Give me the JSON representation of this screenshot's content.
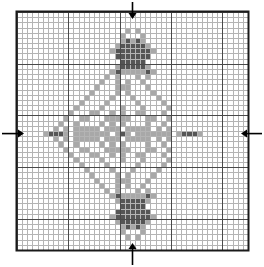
{
  "document": {
    "title": "Cross Stitch Pattern Chart",
    "type": "needlework-chart",
    "description": "Symmetric diamond compass-rose motif on counted grid"
  },
  "chart_data": {
    "type": "heatmap",
    "title": "",
    "xlabel": "",
    "ylabel": "",
    "grid": true,
    "legend_position": "none",
    "cols": 45,
    "rows": 46,
    "bold_every": 10,
    "center_col": 22,
    "center_row": 23,
    "palette": {
      "empty": "#ffffff",
      "light": "#a8a8a8",
      "dark": "#555555"
    },
    "symbols": {
      "0": "empty",
      "1": "light",
      "2": "dark"
    },
    "rle_rows": [
      [
        [
          0,
          45
        ]
      ],
      [
        [
          0,
          45
        ]
      ],
      [
        [
          0,
          45
        ]
      ],
      [
        [
          0,
          21
        ],
        [
          1,
          1
        ],
        [
          0,
          1
        ],
        [
          1,
          1
        ],
        [
          0,
          21
        ]
      ],
      [
        [
          0,
          20
        ],
        [
          1,
          1
        ],
        [
          0,
          3
        ],
        [
          1,
          1
        ],
        [
          0,
          20
        ]
      ],
      [
        [
          0,
          20
        ],
        [
          1,
          1
        ],
        [
          2,
          1
        ],
        [
          1,
          1
        ],
        [
          2,
          1
        ],
        [
          1,
          1
        ],
        [
          0,
          20
        ]
      ],
      [
        [
          0,
          19
        ],
        [
          1,
          1
        ],
        [
          2,
          5
        ],
        [
          1,
          1
        ],
        [
          0,
          19
        ]
      ],
      [
        [
          0,
          18
        ],
        [
          1,
          1
        ],
        [
          2,
          7
        ],
        [
          1,
          1
        ],
        [
          0,
          18
        ]
      ],
      [
        [
          0,
          19
        ],
        [
          2,
          7
        ],
        [
          0,
          19
        ]
      ],
      [
        [
          0,
          20
        ],
        [
          2,
          5
        ],
        [
          0,
          20
        ]
      ],
      [
        [
          0,
          19
        ],
        [
          1,
          1
        ],
        [
          2,
          5
        ],
        [
          1,
          1
        ],
        [
          0,
          19
        ]
      ],
      [
        [
          0,
          18
        ],
        [
          1,
          1
        ],
        [
          2,
          1
        ],
        [
          1,
          5
        ],
        [
          2,
          1
        ],
        [
          1,
          1
        ],
        [
          0,
          18
        ]
      ],
      [
        [
          0,
          17
        ],
        [
          1,
          1
        ],
        [
          0,
          1
        ],
        [
          1,
          1
        ],
        [
          0,
          3
        ],
        [
          1,
          1
        ],
        [
          0,
          1
        ],
        [
          1,
          1
        ],
        [
          0,
          17
        ]
      ],
      [
        [
          0,
          16
        ],
        [
          1,
          1
        ],
        [
          0,
          2
        ],
        [
          1,
          1
        ],
        [
          0,
          1
        ],
        [
          1,
          1
        ],
        [
          0,
          2
        ],
        [
          1,
          1
        ],
        [
          0,
          16
        ]
      ],
      [
        [
          0,
          15
        ],
        [
          1,
          1
        ],
        [
          0,
          3
        ],
        [
          1,
          3
        ],
        [
          0,
          3
        ],
        [
          1,
          1
        ],
        [
          0,
          15
        ]
      ],
      [
        [
          0,
          14
        ],
        [
          1,
          1
        ],
        [
          0,
          4
        ],
        [
          1,
          1
        ],
        [
          0,
          1
        ],
        [
          1,
          1
        ],
        [
          0,
          4
        ],
        [
          1,
          1
        ],
        [
          0,
          14
        ]
      ],
      [
        [
          0,
          13
        ],
        [
          1,
          1
        ],
        [
          0,
          4
        ],
        [
          1,
          1
        ],
        [
          0,
          3
        ],
        [
          1,
          1
        ],
        [
          0,
          4
        ],
        [
          1,
          1
        ],
        [
          0,
          13
        ]
      ],
      [
        [
          0,
          12
        ],
        [
          1,
          1
        ],
        [
          0,
          4
        ],
        [
          1,
          1
        ],
        [
          0,
          5
        ],
        [
          1,
          1
        ],
        [
          0,
          4
        ],
        [
          1,
          1
        ],
        [
          0,
          12
        ]
      ],
      [
        [
          0,
          11
        ],
        [
          1,
          1
        ],
        [
          0,
          4
        ],
        [
          1,
          1
        ],
        [
          0,
          3
        ],
        [
          1,
          1
        ],
        [
          0,
          3
        ],
        [
          1,
          1
        ],
        [
          0,
          4
        ],
        [
          1,
          1
        ],
        [
          0,
          11
        ]
      ],
      [
        [
          0,
          10
        ],
        [
          1,
          1
        ],
        [
          0,
          3
        ],
        [
          1,
          2
        ],
        [
          0,
          2
        ],
        [
          1,
          1
        ],
        [
          0,
          1
        ],
        [
          1,
          1
        ],
        [
          0,
          2
        ],
        [
          1,
          2
        ],
        [
          0,
          3
        ],
        [
          1,
          1
        ],
        [
          0,
          10
        ]
      ],
      [
        [
          0,
          9
        ],
        [
          1,
          1
        ],
        [
          0,
          2
        ],
        [
          1,
          2
        ],
        [
          0,
          3
        ],
        [
          1,
          5
        ],
        [
          0,
          3
        ],
        [
          1,
          2
        ],
        [
          0,
          2
        ],
        [
          1,
          1
        ],
        [
          0,
          9
        ]
      ],
      [
        [
          0,
          8
        ],
        [
          1,
          1
        ],
        [
          0,
          2
        ],
        [
          1,
          1
        ],
        [
          0,
          4
        ],
        [
          1,
          1
        ],
        [
          0,
          1
        ],
        [
          1,
          1
        ],
        [
          0,
          1
        ],
        [
          1,
          1
        ],
        [
          0,
          4
        ],
        [
          1,
          1
        ],
        [
          0,
          2
        ],
        [
          1,
          1
        ],
        [
          0,
          8
        ]
      ],
      [
        [
          0,
          7
        ],
        [
          1,
          1
        ],
        [
          0,
          1
        ],
        [
          1,
          1
        ],
        [
          0,
          1
        ],
        [
          1,
          5
        ],
        [
          0,
          1
        ],
        [
          1,
          3
        ],
        [
          0,
          1
        ],
        [
          1,
          5
        ],
        [
          0,
          1
        ],
        [
          1,
          1
        ],
        [
          0,
          1
        ],
        [
          1,
          1
        ],
        [
          0,
          7
        ]
      ],
      [
        [
          0,
          5
        ],
        [
          1,
          1
        ],
        [
          2,
          3
        ],
        [
          1,
          1
        ],
        [
          0,
          1
        ],
        [
          1,
          7
        ],
        [
          0,
          1
        ],
        [
          1,
          1
        ],
        [
          2,
          1
        ],
        [
          1,
          1
        ],
        [
          0,
          1
        ],
        [
          1,
          7
        ],
        [
          0,
          1
        ],
        [
          1,
          1
        ],
        [
          2,
          3
        ],
        [
          1,
          1
        ],
        [
          0,
          5
        ]
      ],
      [
        [
          0,
          7
        ],
        [
          1,
          1
        ],
        [
          0,
          1
        ],
        [
          1,
          1
        ],
        [
          0,
          1
        ],
        [
          1,
          5
        ],
        [
          0,
          1
        ],
        [
          1,
          3
        ],
        [
          0,
          1
        ],
        [
          1,
          5
        ],
        [
          0,
          1
        ],
        [
          1,
          1
        ],
        [
          0,
          1
        ],
        [
          1,
          1
        ],
        [
          0,
          7
        ]
      ],
      [
        [
          0,
          8
        ],
        [
          1,
          1
        ],
        [
          0,
          2
        ],
        [
          1,
          1
        ],
        [
          0,
          4
        ],
        [
          1,
          1
        ],
        [
          0,
          1
        ],
        [
          1,
          1
        ],
        [
          0,
          1
        ],
        [
          1,
          1
        ],
        [
          0,
          4
        ],
        [
          1,
          1
        ],
        [
          0,
          2
        ],
        [
          1,
          1
        ],
        [
          0,
          8
        ]
      ],
      [
        [
          0,
          9
        ],
        [
          1,
          1
        ],
        [
          0,
          2
        ],
        [
          1,
          2
        ],
        [
          0,
          3
        ],
        [
          1,
          5
        ],
        [
          0,
          3
        ],
        [
          1,
          2
        ],
        [
          0,
          2
        ],
        [
          1,
          1
        ],
        [
          0,
          9
        ]
      ],
      [
        [
          0,
          10
        ],
        [
          1,
          1
        ],
        [
          0,
          3
        ],
        [
          1,
          2
        ],
        [
          0,
          2
        ],
        [
          1,
          1
        ],
        [
          0,
          1
        ],
        [
          1,
          1
        ],
        [
          0,
          2
        ],
        [
          1,
          2
        ],
        [
          0,
          3
        ],
        [
          1,
          1
        ],
        [
          0,
          10
        ]
      ],
      [
        [
          0,
          11
        ],
        [
          1,
          1
        ],
        [
          0,
          4
        ],
        [
          1,
          1
        ],
        [
          0,
          3
        ],
        [
          1,
          1
        ],
        [
          0,
          3
        ],
        [
          1,
          1
        ],
        [
          0,
          4
        ],
        [
          1,
          1
        ],
        [
          0,
          11
        ]
      ],
      [
        [
          0,
          12
        ],
        [
          1,
          1
        ],
        [
          0,
          4
        ],
        [
          1,
          1
        ],
        [
          0,
          5
        ],
        [
          1,
          1
        ],
        [
          0,
          4
        ],
        [
          1,
          1
        ],
        [
          0,
          12
        ]
      ],
      [
        [
          0,
          13
        ],
        [
          1,
          1
        ],
        [
          0,
          4
        ],
        [
          1,
          1
        ],
        [
          0,
          3
        ],
        [
          1,
          1
        ],
        [
          0,
          4
        ],
        [
          1,
          1
        ],
        [
          0,
          13
        ]
      ],
      [
        [
          0,
          14
        ],
        [
          1,
          1
        ],
        [
          0,
          4
        ],
        [
          1,
          1
        ],
        [
          0,
          1
        ],
        [
          1,
          1
        ],
        [
          0,
          4
        ],
        [
          1,
          1
        ],
        [
          0,
          14
        ]
      ],
      [
        [
          0,
          15
        ],
        [
          1,
          1
        ],
        [
          0,
          3
        ],
        [
          1,
          3
        ],
        [
          0,
          3
        ],
        [
          1,
          1
        ],
        [
          0,
          15
        ]
      ],
      [
        [
          0,
          16
        ],
        [
          1,
          1
        ],
        [
          0,
          2
        ],
        [
          1,
          1
        ],
        [
          0,
          1
        ],
        [
          1,
          1
        ],
        [
          0,
          2
        ],
        [
          1,
          1
        ],
        [
          0,
          16
        ]
      ],
      [
        [
          0,
          17
        ],
        [
          1,
          1
        ],
        [
          0,
          1
        ],
        [
          1,
          1
        ],
        [
          0,
          3
        ],
        [
          1,
          1
        ],
        [
          0,
          1
        ],
        [
          1,
          1
        ],
        [
          0,
          17
        ]
      ],
      [
        [
          0,
          18
        ],
        [
          1,
          1
        ],
        [
          2,
          1
        ],
        [
          1,
          5
        ],
        [
          2,
          1
        ],
        [
          1,
          1
        ],
        [
          0,
          18
        ]
      ],
      [
        [
          0,
          19
        ],
        [
          1,
          1
        ],
        [
          2,
          5
        ],
        [
          1,
          1
        ],
        [
          0,
          19
        ]
      ],
      [
        [
          0,
          20
        ],
        [
          2,
          5
        ],
        [
          0,
          20
        ]
      ],
      [
        [
          0,
          19
        ],
        [
          2,
          7
        ],
        [
          0,
          19
        ]
      ],
      [
        [
          0,
          18
        ],
        [
          1,
          1
        ],
        [
          2,
          7
        ],
        [
          1,
          1
        ],
        [
          0,
          18
        ]
      ],
      [
        [
          0,
          19
        ],
        [
          1,
          1
        ],
        [
          2,
          5
        ],
        [
          1,
          1
        ],
        [
          0,
          19
        ]
      ],
      [
        [
          0,
          20
        ],
        [
          1,
          1
        ],
        [
          2,
          1
        ],
        [
          1,
          1
        ],
        [
          2,
          1
        ],
        [
          1,
          1
        ],
        [
          0,
          20
        ]
      ],
      [
        [
          0,
          20
        ],
        [
          1,
          1
        ],
        [
          0,
          3
        ],
        [
          1,
          1
        ],
        [
          0,
          20
        ]
      ],
      [
        [
          0,
          21
        ],
        [
          1,
          1
        ],
        [
          0,
          1
        ],
        [
          1,
          1
        ],
        [
          0,
          21
        ]
      ],
      [
        [
          0,
          45
        ]
      ],
      [
        [
          0,
          45
        ]
      ]
    ]
  },
  "markers": {
    "top_arrow": {
      "name": "center-marker-top",
      "direction": "down",
      "col": 22
    },
    "bottom_arrow": {
      "name": "center-marker-bottom",
      "direction": "up",
      "col": 22
    },
    "left_arrow": {
      "name": "center-marker-left",
      "direction": "right",
      "row": 23
    },
    "right_arrow": {
      "name": "center-marker-right",
      "direction": "left",
      "row": 23
    }
  },
  "geometry": {
    "grid_left": 17,
    "grid_top": 12,
    "grid_right": 248,
    "grid_bottom": 250,
    "cell_size": 5.14,
    "border_color": "#1a1a1a",
    "minor_line_color": "#b4b4b4",
    "major_line_color": "#4a4a4a",
    "background": "#ffffff"
  }
}
